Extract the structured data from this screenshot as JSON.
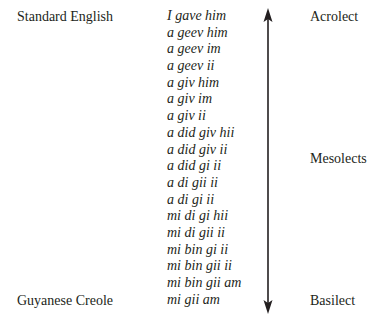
{
  "left_labels": {
    "top": "Standard English",
    "bottom": "Guyanese Creole"
  },
  "right_labels": {
    "top": "Acrolect",
    "middle": "Mesolects",
    "bottom": "Basilect"
  },
  "forms": [
    "I gave him",
    "a geev him",
    "a geev im",
    "a geev ii",
    "a giv him",
    "a giv im",
    "a giv ii",
    "a did giv hii",
    "a did giv ii",
    "a did gi ii",
    "a di gii ii",
    "a di gi ii",
    "mi di gi hii",
    "mi di gii ii",
    "mi bin gi ii",
    "mi bin gii ii",
    "mi bin gii am",
    "mi gii am"
  ],
  "arrow": {
    "type": "double-headed-vertical",
    "color": "#231f20"
  }
}
